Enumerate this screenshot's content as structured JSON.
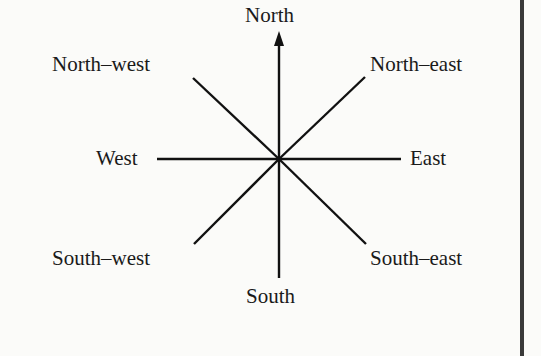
{
  "diagram": {
    "labels": {
      "north": "North",
      "north_east": "North–east",
      "east": "East",
      "south_east": "South–east",
      "south": "South",
      "south_west": "South–west",
      "west": "West",
      "north_west": "North–west"
    },
    "colors": {
      "line": "#111111",
      "background": "#fbfbf9",
      "border": "#3a3a3a"
    },
    "arrow_direction": "north"
  }
}
